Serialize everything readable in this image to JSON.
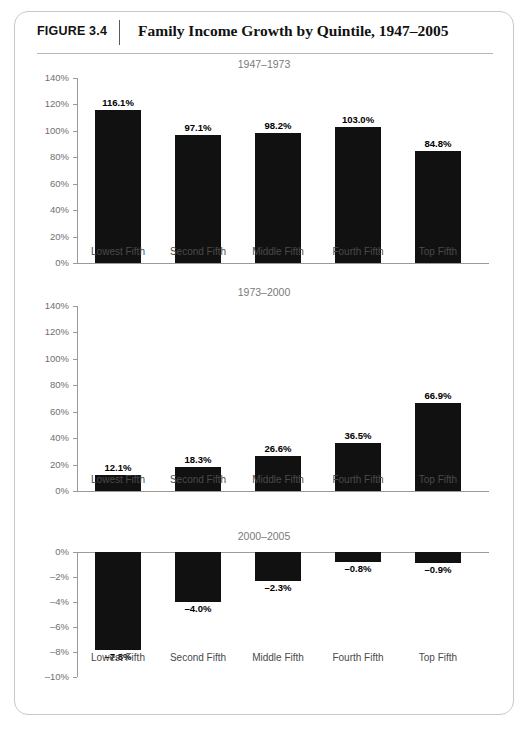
{
  "figure": {
    "number_label": "FIGURE 3.4",
    "title": "Family Income Growth by Quintile, 1947–2005"
  },
  "categories": [
    "Lowest Fifth",
    "Second Fifth",
    "Middle Fifth",
    "Fourth Fifth",
    "Top Fifth"
  ],
  "colors": {
    "bar": "#111111",
    "axis": "#9a9a9a",
    "subtitle": "#7a7a7a",
    "frame_border": "#c9c9c9"
  },
  "chart_data": [
    {
      "type": "bar",
      "title": "1947–1973",
      "xlabel": "",
      "ylabel": "",
      "categories": [
        "Lowest Fifth",
        "Second Fifth",
        "Middle Fifth",
        "Fourth Fifth",
        "Top Fifth"
      ],
      "values": [
        116.1,
        97.1,
        98.2,
        103.0,
        84.8
      ],
      "value_labels": [
        "116.1%",
        "97.1%",
        "98.2%",
        "103.0%",
        "84.8%"
      ],
      "ylim": [
        0,
        140
      ],
      "ytick_values": [
        0,
        20,
        40,
        60,
        80,
        100,
        120,
        140
      ],
      "ytick_labels": [
        "0%",
        "20%",
        "40%",
        "60%",
        "80%",
        "100%",
        "120%",
        "140%"
      ],
      "grid": false,
      "legend": "none"
    },
    {
      "type": "bar",
      "title": "1973–2000",
      "xlabel": "",
      "ylabel": "",
      "categories": [
        "Lowest Fifth",
        "Second Fifth",
        "Middle Fifth",
        "Fourth Fifth",
        "Top Fifth"
      ],
      "values": [
        12.1,
        18.3,
        26.6,
        36.5,
        66.9
      ],
      "value_labels": [
        "12.1%",
        "18.3%",
        "26.6%",
        "36.5%",
        "66.9%"
      ],
      "ylim": [
        0,
        140
      ],
      "ytick_values": [
        0,
        20,
        40,
        60,
        80,
        100,
        120,
        140
      ],
      "ytick_labels": [
        "0%",
        "20%",
        "40%",
        "60%",
        "80%",
        "100%",
        "120%",
        "140%"
      ],
      "grid": false,
      "legend": "none"
    },
    {
      "type": "bar",
      "title": "2000–2005",
      "xlabel": "",
      "ylabel": "",
      "categories": [
        "Lowest Fifth",
        "Second Fifth",
        "Middle Fifth",
        "Fourth Fifth",
        "Top Fifth"
      ],
      "values": [
        -7.8,
        -4.0,
        -2.3,
        -0.8,
        -0.9
      ],
      "value_labels": [
        "–7.8%",
        "–4.0%",
        "–2.3%",
        "–0.8%",
        "–0.9%"
      ],
      "ylim": [
        -10,
        0
      ],
      "ytick_values": [
        0,
        -2,
        -4,
        -6,
        -8,
        -10
      ],
      "ytick_labels": [
        "0%",
        "–2%",
        "–4%",
        "–6%",
        "–8%",
        "–10%"
      ],
      "grid": false,
      "legend": "none"
    }
  ]
}
